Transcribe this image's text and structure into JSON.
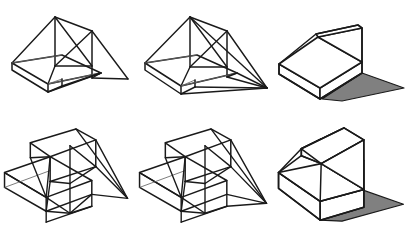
{
  "figure_set": {
    "title": "Shadow construction of a wedge and a two-step block",
    "rows": 2,
    "columns": 3,
    "background_color": "#ffffff",
    "line_color": "#1a1a1a",
    "construction_line_color": "#5a5a5a",
    "shadow_fill_color": "#808080",
    "face_fill_color": "#ffffff"
  },
  "figures": [
    {
      "id": "fig-1",
      "name": "wedge-construction-step-1",
      "row": 1,
      "column": 1,
      "solid": "wedge",
      "stage": "construction",
      "shaded": false,
      "description": "Wireframe wedge with light rays projected from apex points to the ground plane"
    },
    {
      "id": "fig-2",
      "name": "wedge-construction-step-2",
      "row": 1,
      "column": 2,
      "solid": "wedge",
      "stage": "construction",
      "shaded": false,
      "description": "Wireframe wedge with shadow outline closed on the ground plane"
    },
    {
      "id": "fig-3",
      "name": "wedge-result-shaded",
      "row": 1,
      "column": 3,
      "solid": "wedge",
      "stage": "result",
      "shaded": true,
      "description": "Finished wedge solid with grey cast shadow"
    },
    {
      "id": "fig-4",
      "name": "steps-construction-step-1",
      "row": 2,
      "column": 1,
      "solid": "two-step-block",
      "stage": "construction",
      "shaded": false,
      "description": "Wireframe two-step block with light rays projected to the ground plane"
    },
    {
      "id": "fig-5",
      "name": "steps-construction-step-2",
      "row": 2,
      "column": 2,
      "solid": "two-step-block",
      "stage": "construction",
      "shaded": false,
      "description": "Wireframe two-step block with shadow outline closed on the ground plane"
    },
    {
      "id": "fig-6",
      "name": "steps-result-shaded",
      "row": 2,
      "column": 3,
      "solid": "two-step-block",
      "stage": "result",
      "shaded": true,
      "description": "Finished two-step block solid with grey cast shadow"
    }
  ]
}
